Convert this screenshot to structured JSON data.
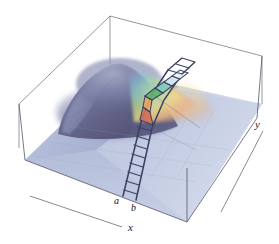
{
  "figure": {
    "background_color": "#ffffff",
    "width": 279,
    "height": 244
  },
  "axes": {
    "x_label": "x",
    "y_label": "y",
    "x_axis_line": {
      "x1": 30,
      "y1": 196,
      "x2": 122,
      "y2": 227,
      "color": "#6b6b78"
    },
    "y_axis_line": {
      "x1": 263,
      "y1": 131,
      "x2": 221,
      "y2": 212,
      "color": "#6b6b78"
    }
  },
  "markers": {
    "a_label": "a",
    "b_label": "b"
  },
  "bounding_box": {
    "color": "#5a5a68",
    "line_width": 0.7,
    "corners": {
      "front_bottom": [
        187,
        222
      ],
      "left_bottom": [
        25,
        160
      ],
      "left_top_back": [
        19,
        104
      ],
      "top_back": [
        110,
        16
      ],
      "right_top_back": [
        262,
        56
      ],
      "right_bottom": [
        257,
        118
      ]
    }
  },
  "surface": {
    "description": "smooth gaussian-like hump on a flat plane",
    "base_color": "#b9c3dc",
    "base_color_dark": "#9aa6c6",
    "hump_color": "#6e6f96",
    "hump_shadow": "#4e4f72",
    "rainbow_colors": [
      "#7fc4d8",
      "#a8d88c",
      "#e9e07a",
      "#f0b46a",
      "#e38a7a",
      "#c98fbe"
    ],
    "peak_center": [
      118,
      68
    ]
  },
  "ladder": {
    "description": "narrow integration slab drawn as a ladder from a,b across the surface",
    "rail_color": "#3b3f63",
    "rung_count": 9,
    "cell_colors": [
      "#5cb36a",
      "#7fd0c3",
      "#a9dff0",
      "#d8e7f2",
      "#e8a15e",
      "#d96a55",
      "#cf8d9e"
    ],
    "base_a": [
      123,
      195
    ],
    "base_b": [
      136,
      200
    ]
  },
  "colors": {
    "ink": "#1a1a22",
    "axis_gray": "#6b6b78",
    "box_gray": "#5a5a68"
  }
}
